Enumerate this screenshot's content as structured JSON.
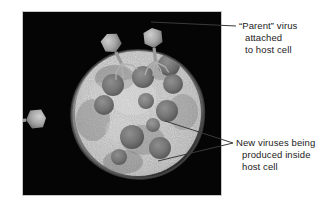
{
  "figure": {
    "type": "electron-micrograph-diagram",
    "panel": {
      "background_color": "#050505",
      "border_color": "#c9c9c9",
      "x": 22,
      "y": 11,
      "width": 200,
      "height": 185
    }
  },
  "annotations": [
    {
      "id": "parent-virus",
      "lines": [
        "“Parent” virus",
        "attached",
        "to host cell"
      ],
      "text_color": "#1b1b1b",
      "leader_target": {
        "x": 152,
        "y": 24
      },
      "leader_origin": {
        "x": 236,
        "y": 26
      }
    },
    {
      "id": "new-viruses",
      "lines": [
        "New viruses being",
        "produced inside",
        "host cell"
      ],
      "text_color": "#1b1b1b",
      "leader_targets": [
        {
          "x": 165,
          "y": 121
        },
        {
          "x": 158,
          "y": 160
        }
      ],
      "leader_origin": {
        "x": 233,
        "y": 143
      }
    }
  ],
  "specimen": {
    "host_cell": {
      "label": "host cell",
      "center_x": 137,
      "center_y": 124,
      "radius": 63,
      "surface": "granular textured cytoplasm"
    },
    "parent_viruses": [
      {
        "label": "bacteriophage",
        "head_x": 151,
        "head_y": 27,
        "rotation": -6
      },
      {
        "label": "bacteriophage",
        "head_x": 106,
        "head_y": 33,
        "rotation": -26
      },
      {
        "label": "bacteriophage",
        "head_x": 45,
        "head_y": 117,
        "rotation": -96
      }
    ],
    "progeny_viruses": [
      {
        "cx": 168,
        "cy": 76,
        "r": 11
      },
      {
        "cx": 172,
        "cy": 95,
        "r": 10
      },
      {
        "cx": 142,
        "cy": 88,
        "r": 11
      },
      {
        "cx": 112,
        "cy": 96,
        "r": 11
      },
      {
        "cx": 103,
        "cy": 116,
        "r": 10
      },
      {
        "cx": 145,
        "cy": 112,
        "r": 8
      },
      {
        "cx": 166,
        "cy": 122,
        "r": 11
      },
      {
        "cx": 131,
        "cy": 148,
        "r": 12
      },
      {
        "cx": 159,
        "cy": 159,
        "r": 11
      },
      {
        "cx": 118,
        "cy": 168,
        "r": 8
      },
      {
        "cx": 152,
        "cy": 136,
        "r": 7
      }
    ]
  }
}
